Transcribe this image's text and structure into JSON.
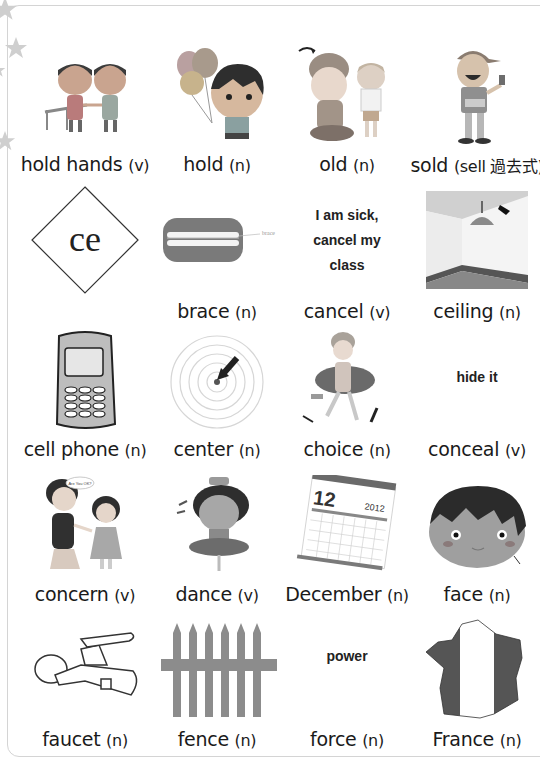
{
  "page": {
    "frame_color": "#d4d4d4",
    "star_color": "#cfcfcf"
  },
  "cards": [
    {
      "word": "hold hands",
      "pos": "(v)",
      "picture": "kids-holding-hands-illustration"
    },
    {
      "word": "hold",
      "pos": "(n)",
      "picture": "boy-holding-balloons-illustration"
    },
    {
      "word": "old",
      "pos": "(n)",
      "picture": "old-man-and-boy-illustration"
    },
    {
      "word": "sold",
      "pos": "(sell 過去式)",
      "picture": "vendor-selling-illustration"
    },
    {
      "word": "",
      "pos": "",
      "picture": "diamond-phonics-card",
      "diamond_text": "ce"
    },
    {
      "word": "brace",
      "pos": "(n)",
      "picture": "teeth-braces-illustration",
      "picture_caption": "brace"
    },
    {
      "word": "cancel",
      "pos": "(v)",
      "picture": "text-note",
      "note_lines": [
        "I am sick,",
        "cancel my",
        "class"
      ]
    },
    {
      "word": "ceiling",
      "pos": "(n)",
      "picture": "room-ceiling-lamp-illustration"
    },
    {
      "word": "cell phone",
      "pos": "(n)",
      "picture": "cell-phone-illustration"
    },
    {
      "word": "center",
      "pos": "(n)",
      "picture": "concentric-circles-arrow-illustration"
    },
    {
      "word": "choice",
      "pos": "(n)",
      "picture": "girl-choosing-illustration"
    },
    {
      "word": "conceal",
      "pos": "(v)",
      "picture": "text-note",
      "note_lines": [
        "hide it"
      ]
    },
    {
      "word": "concern",
      "pos": "(v)",
      "picture": "mother-and-daughter-illustration",
      "speech_bubble": "Are You OK?"
    },
    {
      "word": "dance",
      "pos": "(v)",
      "picture": "dancing-girl-illustration"
    },
    {
      "word": "December",
      "pos": "(n)",
      "picture": "calendar-illustration",
      "calendar_month": "12",
      "calendar_year": "2012"
    },
    {
      "word": "face",
      "pos": "(n)",
      "picture": "boy-face-illustration"
    },
    {
      "word": "faucet",
      "pos": "(n)",
      "picture": "faucet-illustration"
    },
    {
      "word": "fence",
      "pos": "(n)",
      "picture": "fence-illustration"
    },
    {
      "word": "force",
      "pos": "(n)",
      "picture": "text-note",
      "note_lines": [
        "power"
      ]
    },
    {
      "word": "France",
      "pos": "(n)",
      "picture": "france-flag-map-illustration"
    }
  ]
}
